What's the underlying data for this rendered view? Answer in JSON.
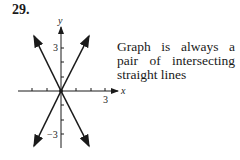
{
  "problem_number": "29.",
  "caption_lines": [
    "Graph is always a",
    "pair of intersecting",
    "straight lines"
  ],
  "graph": {
    "x_axis_label": "x",
    "y_axis_label": "y",
    "x_tick_label": "3",
    "y_tick_label_pos": "3",
    "y_tick_label_neg": "−3",
    "line_color": "#1a1a1a"
  }
}
